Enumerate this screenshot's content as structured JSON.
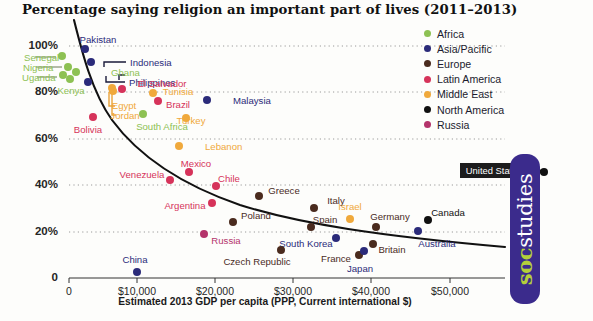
{
  "title": "Percentage saying religion an important part of lives (2011–2013)",
  "axes": {
    "xlabel": "Estimated 2013 GDP per capita (PPP, Current international $)",
    "xticks": [
      "0",
      "$10,000",
      "$20,000",
      "$30,000",
      "$40,000",
      "$50,000"
    ],
    "yticks": [
      "100%",
      "80%",
      "60%",
      "40%",
      "20%",
      "0"
    ]
  },
  "legend": {
    "title": "",
    "items": [
      {
        "label": "Africa",
        "color": "#8dc153"
      },
      {
        "label": "Asia/Pacific",
        "color": "#2b2b7a"
      },
      {
        "label": "Europe",
        "color": "#4a2b1e"
      },
      {
        "label": "Latin America",
        "color": "#d6335a"
      },
      {
        "label": "Middle East",
        "color": "#f0a93c"
      },
      {
        "label": "North America",
        "color": "#111111"
      },
      {
        "label": "Russia",
        "color": "#b4346b"
      }
    ]
  },
  "callout": {
    "label": "United States"
  },
  "badge": {
    "soc": "soc",
    "studies": "studies"
  },
  "chart_data": {
    "type": "scatter",
    "title": "Percentage saying religion an important part of lives (2011–2013)",
    "xlabel": "Estimated 2013 GDP per capita (PPP, Current international $)",
    "ylabel": "Percentage saying religion an important part of lives",
    "xlim": [
      0,
      57000
    ],
    "ylim": [
      0,
      105
    ],
    "grid": "horizontal dotted",
    "legend_position": "top-right",
    "series": [
      {
        "name": "Africa",
        "color": "#8dc153"
      },
      {
        "name": "Asia/Pacific",
        "color": "#2b2b7a"
      },
      {
        "name": "Europe",
        "color": "#4a2b1e"
      },
      {
        "name": "Latin America",
        "color": "#d6335a"
      },
      {
        "name": "Middle East",
        "color": "#f0a93c"
      },
      {
        "name": "North America",
        "color": "#111111"
      },
      {
        "name": "Russia",
        "color": "#b4346b"
      }
    ],
    "points": [
      {
        "name": "Senegal",
        "group": "Africa",
        "x": 2200,
        "y": 97,
        "px": 62,
        "py": 56,
        "lx": 24,
        "ly": 57,
        "anchor": "left",
        "leader": [
          35,
          57,
          56,
          57
        ]
      },
      {
        "name": "Nigeria",
        "group": "Africa",
        "x": 5600,
        "y": 93,
        "px": 68,
        "py": 67,
        "lx": 23,
        "ly": 67,
        "anchor": "left",
        "leader": [
          36,
          67,
          62,
          67
        ]
      },
      {
        "name": "Uganda",
        "group": "Africa",
        "x": 1700,
        "y": 90,
        "px": 63,
        "py": 75,
        "lx": 22,
        "ly": 77,
        "anchor": "left",
        "leader": [
          37,
          77,
          57,
          77
        ]
      },
      {
        "name": "Kenya",
        "group": "Africa",
        "x": 2800,
        "y": 88,
        "px": 70,
        "py": 79,
        "lx": 71,
        "ly": 90,
        "anchor": "center",
        "leader": null
      },
      {
        "name": "Ghana",
        "group": "Africa",
        "x": 3900,
        "y": 91,
        "px": 76,
        "py": 72,
        "lx": 111,
        "ly": 72,
        "anchor": "left",
        "leader": null
      },
      {
        "name": "Pakistan",
        "group": "Asia/Pacific",
        "x": 4700,
        "y": 98,
        "px": 85,
        "py": 49,
        "lx": 98,
        "ly": 39,
        "anchor": "center",
        "leader": null
      },
      {
        "name": "Indonesia",
        "group": "Asia/Pacific",
        "x": 9600,
        "y": 93,
        "px": 91,
        "py": 62,
        "lx": 130,
        "ly": 62,
        "anchor": "left",
        "leader": null
      },
      {
        "name": "Philippines",
        "group": "Asia/Pacific",
        "x": 6500,
        "y": 88,
        "px": 88,
        "py": 82,
        "lx": 129,
        "ly": 82,
        "anchor": "left",
        "leader": null
      },
      {
        "name": "El Salvador",
        "group": "Latin America",
        "x": 7700,
        "y": 82,
        "px": 122,
        "py": 89,
        "lx": 162,
        "ly": 83,
        "anchor": "center",
        "leader": null
      },
      {
        "name": "Egypt",
        "group": "Middle East",
        "x": 10900,
        "y": 83,
        "px": 112,
        "py": 88,
        "lx": 124,
        "ly": 105,
        "anchor": "center",
        "leader": null
      },
      {
        "name": "Jordan",
        "group": "Middle East",
        "x": 11900,
        "y": 82,
        "px": 113,
        "py": 91,
        "lx": 125,
        "ly": 115,
        "anchor": "center",
        "leader": null
      },
      {
        "name": "Tunisia",
        "group": "Middle East",
        "x": 10800,
        "y": 81,
        "px": 153,
        "py": 93,
        "lx": 178,
        "ly": 91,
        "anchor": "center",
        "leader": null
      },
      {
        "name": "Brazil",
        "group": "Latin America",
        "x": 15000,
        "y": 77,
        "px": 158,
        "py": 101,
        "lx": 178,
        "ly": 104,
        "anchor": "center",
        "leader": null
      },
      {
        "name": "Malaysia",
        "group": "Asia/Pacific",
        "x": 23300,
        "y": 80,
        "px": 207,
        "py": 100,
        "lx": 233,
        "ly": 100,
        "anchor": "left",
        "leader": null
      },
      {
        "name": "Turkey",
        "group": "Middle East",
        "x": 19000,
        "y": 73,
        "px": 186,
        "py": 118,
        "lx": 191,
        "ly": 120,
        "anchor": "center",
        "leader": null
      },
      {
        "name": "South Africa",
        "group": "Africa",
        "x": 12700,
        "y": 74,
        "px": 143,
        "py": 114,
        "lx": 162,
        "ly": 126,
        "anchor": "center",
        "leader": null
      },
      {
        "name": "Bolivia",
        "group": "Latin America",
        "x": 5900,
        "y": 70,
        "px": 93,
        "py": 117,
        "lx": 88,
        "ly": 129,
        "anchor": "center",
        "leader": null
      },
      {
        "name": "Lebanon",
        "group": "Middle East",
        "x": 17400,
        "y": 59,
        "px": 179,
        "py": 146,
        "lx": 205,
        "ly": 146,
        "anchor": "left",
        "leader": null
      },
      {
        "name": "Mexico",
        "group": "Latin America",
        "x": 16500,
        "y": 45,
        "px": 189,
        "py": 172,
        "lx": 196,
        "ly": 163,
        "anchor": "center",
        "leader": null
      },
      {
        "name": "Venezuela",
        "group": "Latin America",
        "x": 13600,
        "y": 43,
        "px": 170,
        "py": 180,
        "lx": 142,
        "ly": 174,
        "anchor": "center",
        "leader": null
      },
      {
        "name": "Chile",
        "group": "Latin America",
        "x": 21700,
        "y": 41,
        "px": 216,
        "py": 186,
        "lx": 229,
        "ly": 178,
        "anchor": "center",
        "leader": null
      },
      {
        "name": "Argentina",
        "group": "Latin America",
        "x": 18900,
        "y": 36,
        "px": 212,
        "py": 203,
        "lx": 185,
        "ly": 205,
        "anchor": "center",
        "leader": null
      },
      {
        "name": "Greece",
        "group": "Europe",
        "x": 25700,
        "y": 38,
        "px": 259,
        "py": 196,
        "lx": 284,
        "ly": 190,
        "anchor": "center",
        "leader": null
      },
      {
        "name": "Poland",
        "group": "Europe",
        "x": 23400,
        "y": 30,
        "px": 233,
        "py": 222,
        "lx": 256,
        "ly": 215,
        "anchor": "center",
        "leader": null
      },
      {
        "name": "Italy",
        "group": "Europe",
        "x": 34500,
        "y": 34,
        "px": 314,
        "py": 208,
        "lx": 336,
        "ly": 200,
        "anchor": "center",
        "leader": null
      },
      {
        "name": "Spain",
        "group": "Europe",
        "x": 32900,
        "y": 28,
        "px": 311,
        "py": 227,
        "lx": 325,
        "ly": 219,
        "anchor": "center",
        "leader": null
      },
      {
        "name": "Israel",
        "group": "Middle East",
        "x": 33500,
        "y": 30,
        "px": 350,
        "py": 219,
        "lx": 350,
        "ly": 206,
        "anchor": "center",
        "leader": null
      },
      {
        "name": "Germany",
        "group": "Europe",
        "x": 43000,
        "y": 26,
        "px": 376,
        "py": 227,
        "lx": 390,
        "ly": 216,
        "anchor": "center",
        "leader": null
      },
      {
        "name": "Canada",
        "group": "North America",
        "x": 42700,
        "y": 27,
        "px": 428,
        "py": 220,
        "lx": 448,
        "ly": 212,
        "anchor": "center",
        "leader": null
      },
      {
        "name": "Australia",
        "group": "Asia/Pacific",
        "x": 43000,
        "y": 21,
        "px": 418,
        "py": 231,
        "lx": 437,
        "ly": 243,
        "anchor": "center",
        "leader": null
      },
      {
        "name": "Britain",
        "group": "Europe",
        "x": 37300,
        "y": 17,
        "px": 373,
        "py": 244,
        "lx": 392,
        "ly": 249,
        "anchor": "center",
        "leader": null
      },
      {
        "name": "South Korea",
        "group": "Asia/Pacific",
        "x": 33100,
        "y": 20,
        "px": 336,
        "py": 238,
        "lx": 306,
        "ly": 243,
        "anchor": "center",
        "leader": null
      },
      {
        "name": "France",
        "group": "Europe",
        "x": 37200,
        "y": 14,
        "px": 359,
        "py": 255,
        "lx": 336,
        "ly": 258,
        "anchor": "center",
        "leader": null
      },
      {
        "name": "Japan",
        "group": "Asia/Pacific",
        "x": 36200,
        "y": 11,
        "px": 364,
        "py": 251,
        "lx": 360,
        "ly": 268,
        "anchor": "center",
        "leader": null
      },
      {
        "name": "Czech Republic",
        "group": "Europe",
        "x": 26800,
        "y": 12,
        "px": 281,
        "py": 250,
        "lx": 257,
        "ly": 261,
        "anchor": "center",
        "leader": null
      },
      {
        "name": "Russia",
        "group": "Russia",
        "x": 18900,
        "y": 21,
        "px": 204,
        "py": 234,
        "lx": 226,
        "ly": 240,
        "anchor": "center",
        "leader": null
      },
      {
        "name": "China",
        "group": "Asia/Pacific",
        "x": 9800,
        "y": 3,
        "px": 137,
        "py": 272,
        "lx": 135,
        "ly": 259,
        "anchor": "center",
        "leader": null
      },
      {
        "name": "United States",
        "group": "North America",
        "x": 53000,
        "y": 54,
        "px": 544,
        "py": 172,
        "lx": 493,
        "ly": 171,
        "anchor": "callout",
        "leader": null
      }
    ]
  }
}
